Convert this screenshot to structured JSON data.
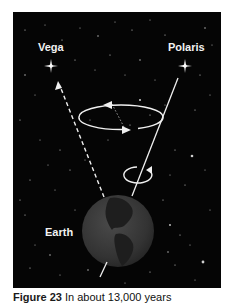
{
  "labels": {
    "vega": "Vega",
    "polaris": "Polaris",
    "earth": "Earth"
  },
  "caption": {
    "figure_number": "Figure 23",
    "text": "In about 13,000 years"
  },
  "colors": {
    "background": "#050505",
    "lines": "#f0f0f0",
    "earth": "#3a3a3a",
    "continents": "#1c1c1c",
    "text": "#f2f2f2"
  }
}
